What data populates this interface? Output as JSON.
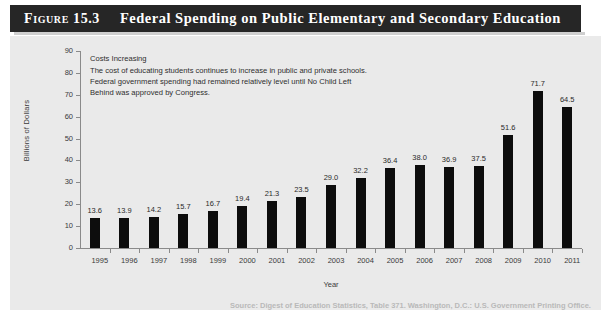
{
  "figure": {
    "number": "Figure 15.3",
    "title": "Federal Spending on Public Elementary and Secondary Education"
  },
  "annotation": {
    "heading": "Costs Increasing",
    "lines": [
      "The cost of educating students continues to increase in public and private schools.",
      "Federal government spending had remained relatively level until No Child Left",
      "Behind was approved by Congress."
    ]
  },
  "source_note": "Source: Digest of Education Statistics, Table 371. Washington, D.C.: U.S. Government Printing Office.",
  "colors": {
    "title_bar": "#262626",
    "panel_background": "#eaeaea",
    "bar": "#0d0d0d",
    "axis": "#8a8a8a",
    "text": "#2e2e2e"
  },
  "chart_data": {
    "type": "bar",
    "title": "Federal Spending on Public Elementary and Secondary Education",
    "xlabel": "Year",
    "ylabel": "Billions of Dollars",
    "ylim": [
      0,
      90
    ],
    "yticks": [
      0,
      10,
      20,
      30,
      40,
      50,
      60,
      70,
      80,
      90
    ],
    "grid": false,
    "legend": null,
    "categories": [
      "1995",
      "1996",
      "1997",
      "1998",
      "1999",
      "2000",
      "2001",
      "2002",
      "2003",
      "2004",
      "2005",
      "2006",
      "2007",
      "2008",
      "2009",
      "2010",
      "2011"
    ],
    "values": [
      13.6,
      13.9,
      14.2,
      15.7,
      16.7,
      19.4,
      21.3,
      23.5,
      29.0,
      32.2,
      36.4,
      38.0,
      36.9,
      37.5,
      51.6,
      71.7,
      64.5
    ],
    "value_labels": [
      "13.6",
      "13.9",
      "14.2",
      "15.7",
      "16.7",
      "19.4",
      "21.3",
      "23.5",
      "29.0",
      "32.2",
      "36.4",
      "38.0",
      "36.9",
      "37.5",
      "51.6",
      "71.7",
      "64.5"
    ],
    "annotations": [
      "Costs Increasing",
      "The cost of educating students continues to increase in public and private schools.",
      "Federal government spending had remained relatively level until No Child Left",
      "Behind was approved by Congress."
    ]
  }
}
